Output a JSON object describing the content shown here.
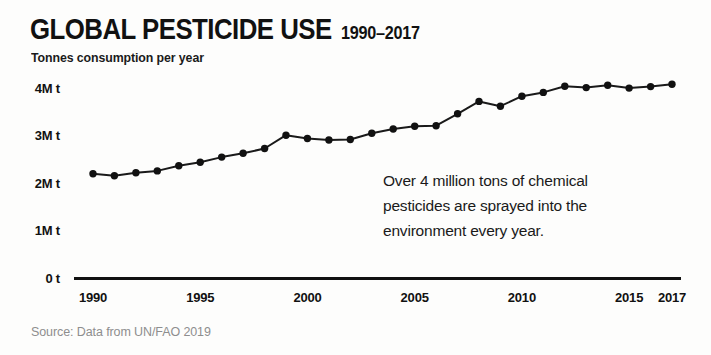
{
  "header": {
    "title": "GLOBAL PESTICIDE USE",
    "range": "1990–2017",
    "subtitle": "Tonnes consumption per year"
  },
  "annotation": {
    "line1": "Over 4 million tons of chemical",
    "line2": "pesticides are sprayed into the",
    "line3": "environment every year."
  },
  "source": "Source: Data from UN/FAO 2019",
  "colors": {
    "ink": "#111111",
    "line": "#1a1a1a",
    "marker": "#111111",
    "source_text": "#8e8e8e",
    "background": "#fdfdfc"
  },
  "chart_data": {
    "type": "line",
    "title": "GLOBAL PESTICIDE USE 1990–2017",
    "subtitle": "Tonnes consumption per year",
    "xlabel": "",
    "ylabel": "Tonnes consumption per year",
    "xlim": [
      1990,
      2017
    ],
    "ylim": [
      0,
      4.3
    ],
    "grid": false,
    "legend": null,
    "y_unit": "million tonnes",
    "y_ticks": [
      0,
      1,
      2,
      3,
      4
    ],
    "y_tick_labels": [
      "0 t",
      "1M t",
      "2M t",
      "3M t",
      "4M t"
    ],
    "x_ticks": [
      1990,
      1995,
      2000,
      2005,
      2010,
      2015,
      2017
    ],
    "x_tick_labels": [
      "1990",
      "1995",
      "2000",
      "2005",
      "2010",
      "2015",
      "2017"
    ],
    "x": [
      1990,
      1991,
      1992,
      1993,
      1994,
      1995,
      1996,
      1997,
      1998,
      1999,
      2000,
      2001,
      2002,
      2003,
      2004,
      2005,
      2006,
      2007,
      2008,
      2009,
      2010,
      2011,
      2012,
      2013,
      2014,
      2015,
      2016,
      2017
    ],
    "values": [
      2.19,
      2.15,
      2.21,
      2.25,
      2.36,
      2.43,
      2.54,
      2.62,
      2.72,
      3.0,
      2.93,
      2.9,
      2.91,
      3.04,
      3.13,
      3.19,
      3.2,
      3.45,
      3.71,
      3.61,
      3.82,
      3.9,
      4.03,
      4.0,
      4.05,
      3.99,
      4.02,
      4.07
    ],
    "annotation": "Over 4 million tons of chemical pesticides are sprayed into the environment every year.",
    "source": "Source: Data from UN/FAO 2019"
  }
}
